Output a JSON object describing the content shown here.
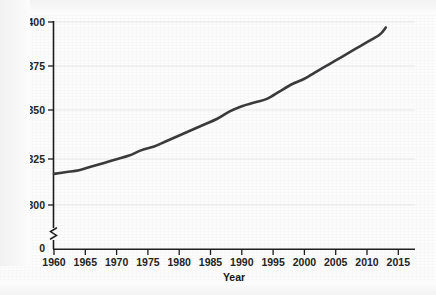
{
  "figure": {
    "background_color": "#fcfcfc",
    "frame_color": "#1d1d1d",
    "gridline_color": "#e9e9ea"
  },
  "axes": {
    "x_title": "Year",
    "y_title": "Carbon dioxide concentration (parts per million)",
    "y_axis_break_symbol": "axis-break-zigzag",
    "x_ticks": [
      "1960",
      "1965",
      "1970",
      "1975",
      "1980",
      "1985",
      "1990",
      "1995",
      "2000",
      "2005",
      "2010",
      "2015"
    ],
    "y_ticks": [
      "0",
      "300",
      "325",
      "350",
      "375",
      "400"
    ]
  },
  "chart_data": {
    "type": "line",
    "title": "",
    "xlabel": "Year",
    "ylabel": "Carbon dioxide concentration (parts per million)",
    "xlim": [
      1960,
      2015
    ],
    "ylim": [
      300,
      400
    ],
    "y_axis_has_break": true,
    "y_axis_break_between": [
      0,
      300
    ],
    "grid": "horizontal",
    "legend": "none",
    "line_color": "#3a3a3c",
    "series": [
      {
        "name": "Atmospheric CO2 concentration",
        "x": [
          1960,
          1962,
          1964,
          1966,
          1968,
          1970,
          1972,
          1974,
          1976,
          1978,
          1980,
          1982,
          1984,
          1986,
          1988,
          1990,
          1992,
          1994,
          1996,
          1998,
          2000,
          2002,
          2004,
          2006,
          2008,
          2010,
          2012,
          2013
        ],
        "values": [
          317,
          318,
          319,
          321,
          323,
          325,
          327,
          330,
          332,
          335,
          338,
          341,
          344,
          347,
          351,
          354,
          356,
          358,
          362,
          366,
          369,
          373,
          377,
          381,
          385,
          389,
          393,
          397
        ]
      }
    ]
  },
  "caption": {
    "ghost_text": ""
  }
}
